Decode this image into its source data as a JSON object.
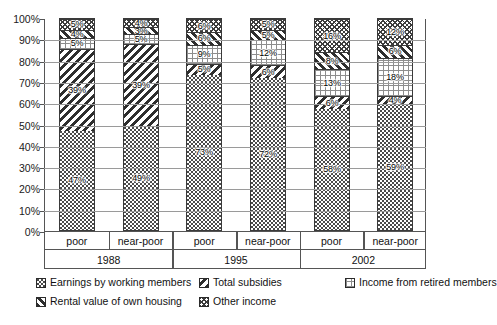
{
  "chart_data": {
    "type": "bar",
    "subtype": "stacked-100-percent",
    "title": "",
    "xlabel": "",
    "ylabel": "",
    "ylim": [
      0,
      100
    ],
    "ytick_labels": [
      "0%",
      "10%",
      "20%",
      "30%",
      "40%",
      "50%",
      "60%",
      "70%",
      "80%",
      "90%",
      "100%"
    ],
    "ytick_values": [
      0,
      10,
      20,
      30,
      40,
      50,
      60,
      70,
      80,
      90,
      100
    ],
    "grid": true,
    "legend_position": "bottom",
    "categories": [
      "poor",
      "near-poor",
      "poor",
      "near-poor",
      "poor",
      "near-poor"
    ],
    "groups": [
      {
        "label": "1988",
        "categories": [
          "poor",
          "near-poor"
        ]
      },
      {
        "label": "1995",
        "categories": [
          "poor",
          "near-poor"
        ]
      },
      {
        "label": "2002",
        "categories": [
          "poor",
          "near-poor"
        ]
      }
    ],
    "series": [
      {
        "name": "Earnings by working members",
        "pattern": "pat-earnings",
        "values": [
          47,
          49,
          73,
          72,
          58,
          59
        ],
        "labels": [
          "47%",
          "49%",
          "73%",
          "72%",
          "58%",
          "59%"
        ]
      },
      {
        "name": "Total subsidies",
        "pattern": "pat-subsidies",
        "values": [
          39,
          39,
          5,
          6,
          6,
          4
        ],
        "labels": [
          "39%",
          "39%",
          "5%",
          "6%",
          "6%",
          "4%"
        ]
      },
      {
        "name": "Income from retired members",
        "pattern": "pat-retired",
        "values": [
          5,
          5,
          9,
          12,
          13,
          18
        ],
        "labels": [
          "5%",
          "5%",
          "9%",
          "12%",
          "13%",
          "18%"
        ]
      },
      {
        "name": "Rental value of own housing",
        "pattern": "pat-rental",
        "values": [
          4,
          3,
          6,
          5,
          8,
          6
        ],
        "labels": [
          "4%",
          "3%",
          "6%",
          "5%",
          "8%",
          "6%"
        ]
      },
      {
        "name": "Other income",
        "pattern": "pat-other",
        "values": [
          5,
          4,
          6,
          5,
          16,
          12
        ],
        "labels": [
          "5%",
          "4%",
          "6%",
          "5%",
          "16%",
          "12%"
        ]
      }
    ]
  },
  "legend": {
    "rows": [
      [
        {
          "label": "Earnings by working members",
          "pattern": "pat-earnings"
        },
        {
          "label": "Total subsidies",
          "pattern": "pat-subsidies"
        },
        {
          "label": "Income from retired members",
          "pattern": "pat-retired"
        }
      ],
      [
        {
          "label": "Rental value of own housing",
          "pattern": "pat-rental"
        },
        {
          "label": "Other income",
          "pattern": "pat-other"
        }
      ]
    ]
  },
  "colors": {
    "axis": "#555555",
    "gridline": "#9a9a9a",
    "ink": "#2e2e2e",
    "background": "#ffffff"
  }
}
